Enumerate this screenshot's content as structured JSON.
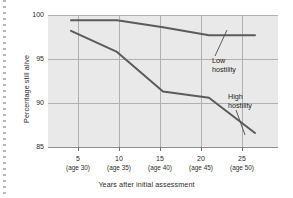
{
  "figure": {
    "plot_background": "#e9e9e9",
    "line_color": "#5b5b5b",
    "grid_color": "#b0b0b0",
    "text_color": "#2b2b2b"
  },
  "chart_data": {
    "type": "line",
    "title": "",
    "xlabel": "Years after initial assessment",
    "ylabel": "Percentage still alive",
    "x": [
      5,
      10,
      15,
      20,
      25
    ],
    "xtick_labels": [
      "5",
      "10",
      "15",
      "20",
      "25"
    ],
    "xtick_sublabels": [
      "(age 30)",
      "(age 35)",
      "(age 40)",
      "(age 45)",
      "(age 50)"
    ],
    "ytick_labels": [
      "85",
      "90",
      "95",
      "100"
    ],
    "yticks": [
      85,
      90,
      95,
      100
    ],
    "xlim": [
      2.5,
      27.5
    ],
    "ylim": [
      85,
      100
    ],
    "grid": true,
    "legend": "none",
    "series": [
      {
        "name": "Low hostility",
        "values": [
          99.4,
          99.4,
          98.6,
          97.7,
          97.7
        ]
      },
      {
        "name": "High hostility",
        "values": [
          98.2,
          95.8,
          91.3,
          90.6,
          86.6
        ]
      }
    ],
    "annotations": [
      {
        "text_line1": "Low",
        "text_line2": "hostility",
        "target_series": "Low hostility"
      },
      {
        "text_line1": "High",
        "text_line2": "hostility",
        "target_series": "High hostility"
      }
    ]
  }
}
